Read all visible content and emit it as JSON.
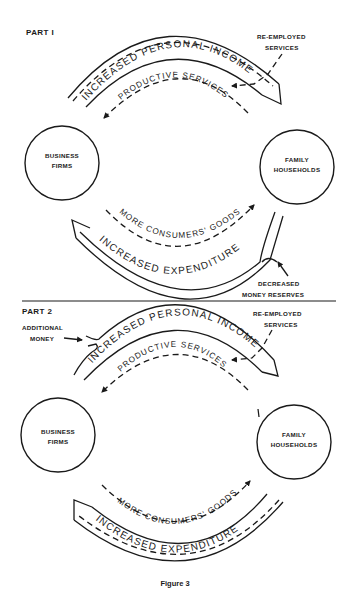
{
  "figure": {
    "caption": "Figure 3",
    "part1": {
      "title": "PART I",
      "nodes": {
        "business": {
          "line1": "BUSINESS",
          "line2": "FIRMS"
        },
        "households": {
          "line1": "FAMILY",
          "line2": "HOUSEHOLDS"
        }
      },
      "flows": {
        "income": "INCREASED PERSONAL INCOME",
        "productive": "PRODUCTIVE SERVICES",
        "goods": "MORE CONSUMERS' GOODS",
        "expenditure": "INCREASED EXPENDITURE"
      },
      "annotations": {
        "reemployed_line1": "RE-EMPLOYED",
        "reemployed_line2": "SERVICES",
        "reserves_line1": "DECREASED",
        "reserves_line2": "MONEY RESERVES"
      }
    },
    "part2": {
      "title": "PART 2",
      "nodes": {
        "business": {
          "line1": "BUSINESS",
          "line2": "FIRMS"
        },
        "households": {
          "line1": "FAMILY",
          "line2": "HOUSEHOLDS"
        }
      },
      "flows": {
        "income": "INCREASED PERSONAL INCOME",
        "productive": "PRODUCTIVE SERVICES",
        "goods": "MORE CONSUMERS' GOODS",
        "expenditure": "INCREASED EXPENDITURE"
      },
      "annotations": {
        "reemployed_line1": "RE-EMPLOYED",
        "reemployed_line2": "SERVICES",
        "additional_line1": "ADDITIONAL",
        "additional_line2": "MONEY"
      }
    }
  },
  "colors": {
    "ink": "#1a1a1a",
    "paper": "#ffffff"
  }
}
